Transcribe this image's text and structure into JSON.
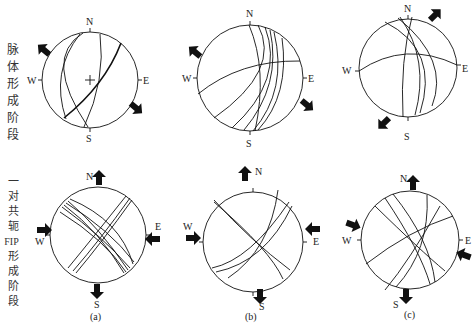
{
  "row_labels": {
    "top": [
      "脉",
      "体",
      "形",
      "成",
      "阶",
      "段"
    ],
    "bottom": [
      "一",
      "对",
      "共",
      "轭",
      "FIP",
      "形",
      "成",
      "阶",
      "段"
    ]
  },
  "compass": {
    "n": "N",
    "s": "S",
    "e": "E",
    "w": "W"
  },
  "panels": [
    {
      "label": "(a)",
      "top": {
        "cx": 90,
        "cy": 80,
        "r": 48
      },
      "bottom": {
        "cx": 98,
        "cy": 235,
        "r": 48
      }
    },
    {
      "label": "(b)",
      "top": {
        "cx": 250,
        "cy": 78,
        "r": 53
      },
      "bottom": {
        "cx": 253,
        "cy": 242,
        "r": 50
      }
    },
    {
      "label": "(c)",
      "top": {
        "cx": 408,
        "cy": 68,
        "r": 49
      },
      "bottom": {
        "cx": 410,
        "cy": 240,
        "r": 49
      }
    }
  ],
  "colors": {
    "line": "#111111",
    "text": "#222222"
  }
}
